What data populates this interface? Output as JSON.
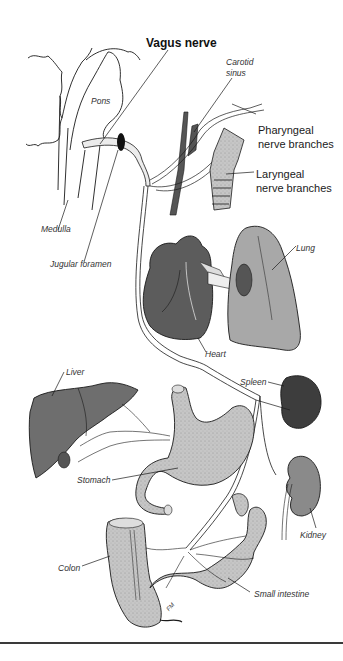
{
  "figure": {
    "title": "Vagus nerve",
    "labels": {
      "carotid_sinus_line1": "Carotid",
      "carotid_sinus_line2": "sinus",
      "pons": "Pons",
      "pharyngeal_line1": "Pharyngeal",
      "pharyngeal_line2": "nerve branches",
      "laryngeal_line1": "Laryngeal",
      "laryngeal_line2": "nerve branches",
      "medulla": "Medulla",
      "jugular_foramen": "Jugular foramen",
      "lung": "Lung",
      "heart": "Heart",
      "liver": "Liver",
      "spleen": "Spleen",
      "stomach": "Stomach",
      "kidney": "Kidney",
      "colon": "Colon",
      "small_intestine": "Small intestine"
    },
    "artist_signature": "FM",
    "colors": {
      "outline": "#1a1a1a",
      "nerve_fill": "#e8e8e8",
      "heart": "#5c5c5c",
      "spleen": "#3d3d3d",
      "liver": "#6e6e6e",
      "lung": "#a8a8a8",
      "kidney": "#8a8a8a",
      "gi_tract": "#c4c4c4",
      "artery": "#555555",
      "rule": "#3a3a3a"
    }
  }
}
